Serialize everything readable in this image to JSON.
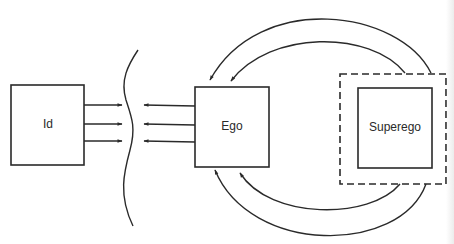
{
  "diagram": {
    "nodes": [
      {
        "id": "id",
        "label": "Id"
      },
      {
        "id": "ego",
        "label": "Ego"
      },
      {
        "id": "superego",
        "label": "Superego",
        "enclosure": "dashed-boundary"
      }
    ],
    "edges": [
      {
        "from": "id",
        "to": "barrier",
        "count": 3,
        "direction": "right"
      },
      {
        "from": "ego",
        "to": "barrier",
        "count": 3,
        "direction": "left"
      },
      {
        "from": "superego",
        "to": "ego",
        "count": 2,
        "path": "arc-over-top"
      },
      {
        "from": "superego",
        "to": "ego",
        "count": 2,
        "path": "arc-under-bottom"
      }
    ],
    "barrier": {
      "type": "wavy-line",
      "between": [
        "id",
        "ego"
      ]
    }
  },
  "colors": {
    "stroke": "#2a2a2a",
    "background": "#ffffff"
  }
}
